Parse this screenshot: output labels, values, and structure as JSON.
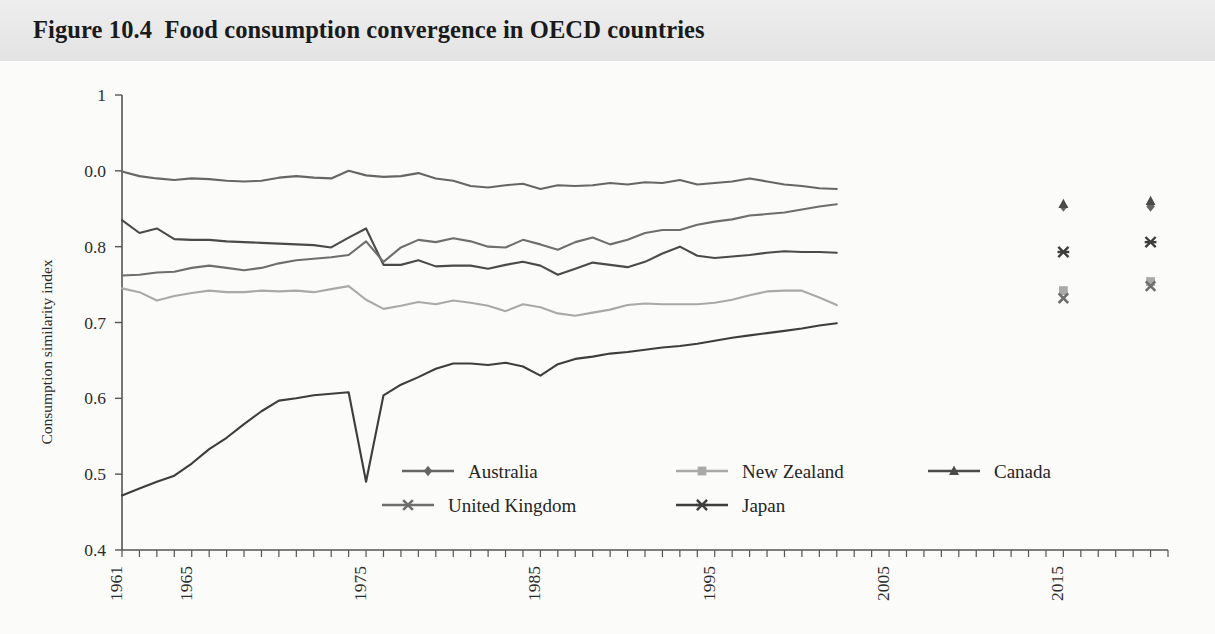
{
  "figure": {
    "number": "Figure 10.4",
    "title": "Figure 10.4  Food consumption convergence in OECD countries",
    "caption_text": "Food consumption convergence in OECD countries"
  },
  "chart_data": {
    "type": "line",
    "title": "Food consumption convergence in OECD countries",
    "xlabel": "",
    "ylabel": "Consumption similarity index",
    "xlim": [
      1961,
      2021
    ],
    "ylim": [
      0.4,
      1.0
    ],
    "grid": false,
    "legend_position": "bottom-center",
    "y_ticks": [
      "0.4",
      "0.5",
      "0.6",
      "0.7",
      "0.8",
      "0.0",
      "1"
    ],
    "y_tick_values": [
      0.4,
      0.5,
      0.6,
      0.7,
      0.8,
      0.9,
      1.0
    ],
    "x_ticks": [
      "1961",
      "1965",
      "1975",
      "1985",
      "1995",
      "2005",
      "2015"
    ],
    "x_tick_values": [
      1961,
      1965,
      1975,
      1985,
      1995,
      2005,
      2015
    ],
    "x_minor_tick_step": 1,
    "series": [
      {
        "name": "Australia",
        "marker": "diamond",
        "color": "#666666",
        "x_start": 1961,
        "values": [
          0.899,
          0.893,
          0.89,
          0.888,
          0.89,
          0.889,
          0.887,
          0.886,
          0.887,
          0.891,
          0.893,
          0.891,
          0.89,
          0.9,
          0.894,
          0.892,
          0.893,
          0.897,
          0.89,
          0.887,
          0.88,
          0.878,
          0.881,
          0.883,
          0.876,
          0.881,
          0.88,
          0.881,
          0.884,
          0.882,
          0.885,
          0.884,
          0.888,
          0.882,
          0.884,
          0.886,
          0.89,
          0.886,
          0.882,
          0.88,
          0.877,
          0.876
        ]
      },
      {
        "name": "New Zealand",
        "marker": "square",
        "color": "#a9a9a9",
        "x_start": 1961,
        "values": [
          0.745,
          0.74,
          0.729,
          0.735,
          0.739,
          0.742,
          0.74,
          0.74,
          0.742,
          0.741,
          0.742,
          0.74,
          0.744,
          0.748,
          0.73,
          0.718,
          0.722,
          0.727,
          0.724,
          0.729,
          0.726,
          0.722,
          0.715,
          0.724,
          0.72,
          0.712,
          0.709,
          0.713,
          0.717,
          0.723,
          0.725,
          0.724,
          0.724,
          0.724,
          0.726,
          0.73,
          0.736,
          0.741,
          0.742,
          0.742,
          0.733,
          0.723
        ]
      },
      {
        "name": "Canada",
        "marker": "triangle",
        "color": "#4a4a4a",
        "x_start": 1961,
        "values": [
          0.835,
          0.818,
          0.824,
          0.81,
          0.809,
          0.809,
          0.807,
          0.806,
          0.805,
          0.804,
          0.803,
          0.802,
          0.799,
          0.812,
          0.824,
          0.776,
          0.776,
          0.782,
          0.774,
          0.775,
          0.775,
          0.771,
          0.776,
          0.78,
          0.775,
          0.763,
          0.771,
          0.779,
          0.776,
          0.773,
          0.78,
          0.791,
          0.8,
          0.788,
          0.785,
          0.787,
          0.789,
          0.792,
          0.794,
          0.793,
          0.793,
          0.792
        ]
      },
      {
        "name": "United Kingdom",
        "marker": "x",
        "color": "#6e6e6e",
        "x_start": 1961,
        "values": [
          0.762,
          0.763,
          0.766,
          0.767,
          0.772,
          0.775,
          0.772,
          0.769,
          0.772,
          0.778,
          0.782,
          0.784,
          0.786,
          0.789,
          0.807,
          0.78,
          0.799,
          0.809,
          0.806,
          0.811,
          0.807,
          0.8,
          0.799,
          0.809,
          0.803,
          0.796,
          0.806,
          0.812,
          0.803,
          0.809,
          0.818,
          0.822,
          0.822,
          0.829,
          0.833,
          0.836,
          0.841,
          0.843,
          0.845,
          0.849,
          0.853,
          0.856
        ]
      },
      {
        "name": "Japan",
        "marker": "asterisk",
        "color": "#3d3d3d",
        "x_start": 1961,
        "values": [
          0.472,
          0.481,
          0.49,
          0.498,
          0.514,
          0.533,
          0.548,
          0.566,
          0.583,
          0.597,
          0.6,
          0.604,
          0.606,
          0.608,
          0.49,
          0.604,
          0.618,
          0.628,
          0.639,
          0.646,
          0.646,
          0.644,
          0.647,
          0.642,
          0.63,
          0.645,
          0.652,
          0.655,
          0.659,
          0.661,
          0.664,
          0.667,
          0.669,
          0.672,
          0.676,
          0.68,
          0.683,
          0.686,
          0.689,
          0.692,
          0.696,
          0.699
        ]
      }
    ],
    "isolated_points": [
      {
        "series": "Australia",
        "x": 2015,
        "y": 0.853,
        "marker": "diamond"
      },
      {
        "series": "Canada",
        "x": 2015,
        "y": 0.856,
        "marker": "triangle"
      },
      {
        "series": "Japan",
        "x": 2015,
        "y": 0.793,
        "marker": "asterisk"
      },
      {
        "series": "New Zealand",
        "x": 2015,
        "y": 0.742,
        "marker": "square"
      },
      {
        "series": "United Kingdom",
        "x": 2015,
        "y": 0.732,
        "marker": "x"
      },
      {
        "series": "Australia",
        "x": 2020,
        "y": 0.853,
        "marker": "diamond"
      },
      {
        "series": "Canada",
        "x": 2020,
        "y": 0.86,
        "marker": "triangle"
      },
      {
        "series": "Japan",
        "x": 2020,
        "y": 0.806,
        "marker": "asterisk"
      },
      {
        "series": "New Zealand",
        "x": 2020,
        "y": 0.754,
        "marker": "square"
      },
      {
        "series": "United Kingdom",
        "x": 2020,
        "y": 0.748,
        "marker": "x"
      }
    ]
  },
  "legend": {
    "entries": [
      {
        "label": "Australia",
        "marker": "diamond",
        "color": "#666666"
      },
      {
        "label": "New Zealand",
        "marker": "square",
        "color": "#a9a9a9"
      },
      {
        "label": "Canada",
        "marker": "triangle",
        "color": "#4a4a4a"
      },
      {
        "label": "United Kingdom",
        "marker": "x",
        "color": "#6e6e6e"
      },
      {
        "label": "Japan",
        "marker": "asterisk",
        "color": "#3d3d3d"
      }
    ]
  },
  "axes": {
    "y_label": "Consumption similarity index",
    "y_ticks": [
      "1",
      "0.0",
      "0.8",
      "0.7",
      "0.6",
      "0.5",
      "0.4"
    ],
    "x_ticks": [
      "1961",
      "1965",
      "1975",
      "1985",
      "1995",
      "2005",
      "2015"
    ]
  },
  "colors": {
    "title_band": "#e9e9e9",
    "page_background": "#fbfbfa",
    "axis": "#555555",
    "text": "#2b2b2b"
  }
}
